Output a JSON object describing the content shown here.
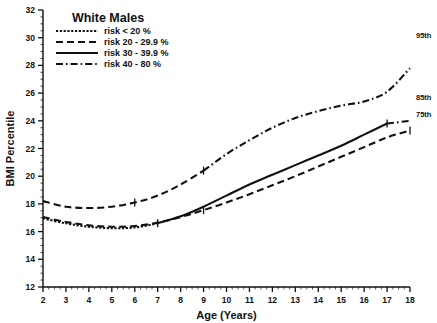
{
  "chart_data": {
    "type": "line",
    "title": "White Males",
    "xlabel": "Age (Years)",
    "ylabel": "BMI Percentile",
    "xlim": [
      2,
      18
    ],
    "ylim": [
      12,
      32
    ],
    "xticks": [
      2,
      3,
      4,
      5,
      6,
      7,
      8,
      9,
      10,
      11,
      12,
      13,
      14,
      15,
      16,
      17,
      18
    ],
    "yticks": [
      12,
      14,
      16,
      18,
      20,
      22,
      24,
      26,
      28,
      30,
      32
    ],
    "grid": false,
    "legend_position": "top-left",
    "legend": [
      {
        "label": "risk < 20 %",
        "style": "dotted"
      },
      {
        "label": "risk 20 - 29.9 %",
        "style": "dashed"
      },
      {
        "label": "risk 30 - 39.9 %",
        "style": "solid"
      },
      {
        "label": "risk 40 - 80 %",
        "style": "dashdot"
      }
    ],
    "annotations": [
      {
        "text": "95th",
        "x": 18,
        "y": 30.2
      },
      {
        "text": "85th",
        "x": 18,
        "y": 25.7
      },
      {
        "text": "75th",
        "x": 18,
        "y": 24.5
      }
    ],
    "x": [
      2,
      3,
      4,
      5,
      6,
      7,
      8,
      9,
      10,
      11,
      12,
      13,
      14,
      15,
      16,
      17,
      18
    ],
    "series": [
      {
        "name": "95th",
        "percentile": "95th",
        "segments": [
          {
            "style": "dashed",
            "x": [
              2,
              3,
              4,
              5,
              6,
              7,
              8,
              9
            ],
            "values": [
              18.2,
              17.8,
              17.7,
              17.8,
              18.1,
              18.6,
              19.4,
              20.4
            ]
          },
          {
            "style": "dashdot",
            "x": [
              9,
              10,
              11,
              12,
              13,
              14,
              15,
              16,
              17,
              18
            ],
            "values": [
              20.4,
              21.6,
              22.6,
              23.5,
              24.2,
              24.7,
              25.1,
              25.4,
              26.1,
              27.8
            ]
          }
        ],
        "values": [
          18.2,
          17.8,
          17.7,
          17.8,
          18.1,
          18.6,
          19.4,
          20.4,
          21.6,
          22.6,
          23.5,
          24.2,
          24.7,
          25.1,
          25.4,
          26.1,
          27.8
        ]
      },
      {
        "name": "85th",
        "percentile": "85th",
        "segments": [
          {
            "style": "dotted",
            "x": [
              2,
              3,
              4,
              5,
              6,
              7
            ],
            "values": [
              16.95,
              16.6,
              16.35,
              16.25,
              16.3,
              16.6
            ]
          },
          {
            "style": "solid",
            "x": [
              7,
              8,
              9,
              10,
              11,
              12,
              13,
              14,
              15,
              16,
              17
            ],
            "values": [
              16.6,
              17.1,
              17.8,
              18.6,
              19.4,
              20.1,
              20.8,
              21.5,
              22.2,
              23.0,
              23.8
            ]
          },
          {
            "style": "dashdot",
            "x": [
              17,
              18
            ],
            "values": [
              23.8,
              24.0
            ]
          }
        ],
        "values": [
          16.95,
          16.6,
          16.35,
          16.25,
          16.3,
          16.6,
          17.1,
          17.8,
          18.6,
          19.4,
          20.1,
          20.8,
          21.5,
          22.2,
          23.0,
          23.8,
          24.0
        ]
      },
      {
        "name": "75th",
        "percentile": "75th",
        "segments": [
          {
            "style": "dashed",
            "x": [
              2,
              3,
              4,
              5,
              6,
              7,
              8,
              9,
              10,
              11,
              12,
              13,
              14,
              15,
              16,
              17,
              18
            ],
            "values": [
              17.05,
              16.7,
              16.45,
              16.35,
              16.4,
              16.65,
              17.05,
              17.55,
              18.1,
              18.7,
              19.35,
              20.0,
              20.7,
              21.4,
              22.1,
              22.8,
              23.3
            ]
          }
        ],
        "values": [
          17.05,
          16.7,
          16.45,
          16.35,
          16.4,
          16.65,
          17.05,
          17.55,
          18.1,
          18.7,
          19.35,
          20.0,
          20.7,
          21.4,
          22.1,
          22.8,
          23.3
        ]
      }
    ]
  },
  "colors": {
    "ink": "#111111",
    "background": "#ffffff"
  }
}
